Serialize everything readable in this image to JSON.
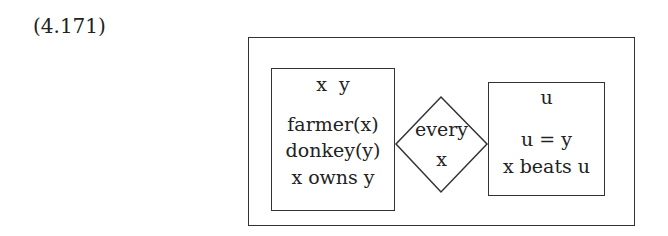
{
  "example_number": "(4.171)",
  "drs": {
    "antecedent": {
      "universe": "x  y",
      "conditions": [
        "farmer(x)",
        "donkey(y)",
        "x owns y"
      ]
    },
    "quantifier": {
      "line1": "every",
      "line2": "x"
    },
    "consequent": {
      "universe": "u",
      "conditions": [
        "u = y",
        "x beats u"
      ]
    }
  }
}
